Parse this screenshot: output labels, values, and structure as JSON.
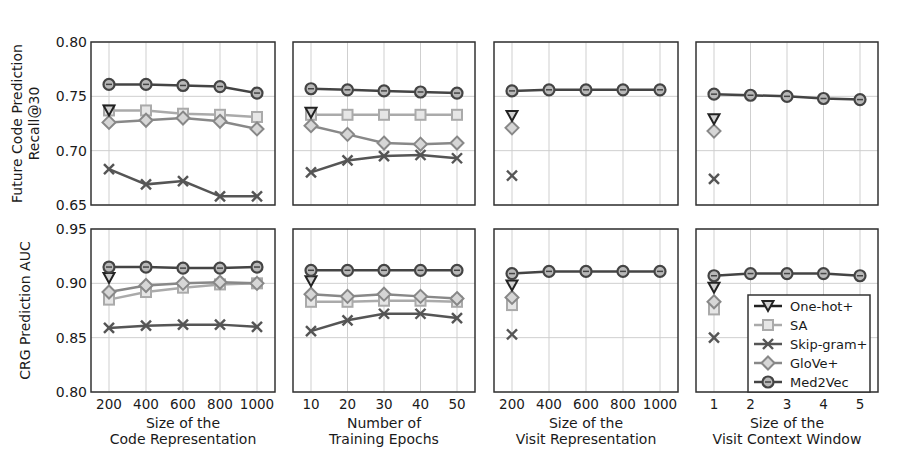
{
  "chart_data": {
    "type": "line",
    "layout": {
      "rows": 2,
      "cols": 4,
      "grid": true,
      "legend_position": "lower right of panel (row 2, col 4)"
    },
    "row_ylabels": [
      "Future Code Prediction\nRecall@30",
      "CRG Prediction AUC"
    ],
    "row_ylims": [
      [
        0.65,
        0.8
      ],
      [
        0.8,
        0.95
      ]
    ],
    "row_yticks": [
      [
        "0.65",
        "0.70",
        "0.75",
        "0.80"
      ],
      [
        "0.80",
        "0.85",
        "0.90",
        "0.95"
      ]
    ],
    "legend": [
      {
        "name": "One-hot+",
        "marker": "triangle-down",
        "color": "#222222"
      },
      {
        "name": "SA",
        "marker": "square",
        "color": "#aaaaaa"
      },
      {
        "name": "Skip-gram+",
        "marker": "x",
        "color": "#555555"
      },
      {
        "name": "GloVe+",
        "marker": "diamond",
        "color": "#888888"
      },
      {
        "name": "Med2Vec",
        "marker": "circle",
        "color": "#444444"
      }
    ],
    "columns": [
      {
        "xlabel": "Size of the\nCode Representation",
        "x": [
          200,
          400,
          600,
          800,
          1000
        ],
        "xticks": [
          "200",
          "400",
          "600",
          "800",
          "1000"
        ],
        "top": {
          "One-hot+": [
            0.737
          ],
          "SA": [
            0.737,
            0.737,
            0.734,
            0.733,
            0.731
          ],
          "Skip-gram+": [
            0.683,
            0.669,
            0.672,
            0.658,
            0.658
          ],
          "GloVe+": [
            0.726,
            0.728,
            0.73,
            0.727,
            0.72
          ],
          "Med2Vec": [
            0.761,
            0.761,
            0.76,
            0.759,
            0.753
          ]
        },
        "bottom": {
          "One-hot+": [
            0.905
          ],
          "SA": [
            0.885,
            0.892,
            0.896,
            0.899,
            0.9
          ],
          "Skip-gram+": [
            0.859,
            0.861,
            0.862,
            0.862,
            0.86
          ],
          "GloVe+": [
            0.892,
            0.898,
            0.9,
            0.901,
            0.9
          ],
          "Med2Vec": [
            0.915,
            0.915,
            0.914,
            0.914,
            0.915
          ]
        }
      },
      {
        "xlabel": "Number of\nTraining Epochs",
        "x": [
          10,
          20,
          30,
          40,
          50
        ],
        "xticks": [
          "10",
          "20",
          "30",
          "40",
          "50"
        ],
        "top": {
          "One-hot+": [
            0.735
          ],
          "SA": [
            0.733,
            0.733,
            0.733,
            0.733,
            0.733
          ],
          "Skip-gram+": [
            0.68,
            0.691,
            0.695,
            0.696,
            0.693
          ],
          "GloVe+": [
            0.723,
            0.715,
            0.707,
            0.706,
            0.707
          ],
          "Med2Vec": [
            0.757,
            0.756,
            0.755,
            0.754,
            0.753
          ]
        },
        "bottom": {
          "One-hot+": [
            0.902
          ],
          "SA": [
            0.883,
            0.883,
            0.884,
            0.884,
            0.883
          ],
          "Skip-gram+": [
            0.856,
            0.866,
            0.872,
            0.872,
            0.868
          ],
          "GloVe+": [
            0.89,
            0.888,
            0.89,
            0.888,
            0.886
          ],
          "Med2Vec": [
            0.912,
            0.912,
            0.912,
            0.912,
            0.912
          ]
        }
      },
      {
        "xlabel": "Size of the\nVisit Representation",
        "x": [
          200,
          400,
          600,
          800,
          1000
        ],
        "xticks": [
          "200",
          "400",
          "600",
          "800",
          "1000"
        ],
        "top": {
          "One-hot+": [
            0.732
          ],
          "SA": [],
          "Skip-gram+": [
            0.677
          ],
          "GloVe+": [
            0.721
          ],
          "Med2Vec": [
            0.755,
            0.756,
            0.756,
            0.756,
            0.756
          ]
        },
        "bottom": {
          "One-hot+": [
            0.898
          ],
          "SA": [
            0.88
          ],
          "Skip-gram+": [
            0.853
          ],
          "GloVe+": [
            0.887
          ],
          "Med2Vec": [
            0.909,
            0.911,
            0.911,
            0.911,
            0.911
          ]
        }
      },
      {
        "xlabel": "Size of the\nVisit Context Window",
        "x": [
          1,
          2,
          3,
          4,
          5
        ],
        "xticks": [
          "1",
          "2",
          "3",
          "4",
          "5"
        ],
        "top": {
          "One-hot+": [
            0.729
          ],
          "SA": [],
          "Skip-gram+": [
            0.674
          ],
          "GloVe+": [
            0.718
          ],
          "Med2Vec": [
            0.752,
            0.751,
            0.75,
            0.748,
            0.747
          ]
        },
        "bottom": {
          "One-hot+": [
            0.896
          ],
          "SA": [
            0.876
          ],
          "Skip-gram+": [
            0.85
          ],
          "GloVe+": [
            0.883
          ],
          "Med2Vec": [
            0.907,
            0.909,
            0.909,
            0.909,
            0.907
          ]
        }
      }
    ]
  }
}
